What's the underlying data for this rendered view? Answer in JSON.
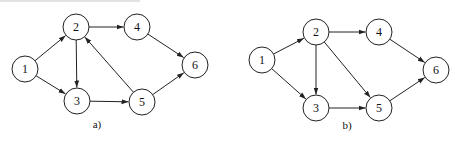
{
  "diagrams": [
    {
      "id": "a",
      "caption": "a)",
      "caption_pos": [
        97,
        128
      ],
      "nodes": [
        {
          "label": "1",
          "x": 25,
          "y": 69
        },
        {
          "label": "2",
          "x": 76,
          "y": 27
        },
        {
          "label": "3",
          "x": 77,
          "y": 101
        },
        {
          "label": "4",
          "x": 137,
          "y": 27
        },
        {
          "label": "5",
          "x": 142,
          "y": 102
        },
        {
          "label": "6",
          "x": 195,
          "y": 65
        }
      ],
      "edges": [
        {
          "from": "1",
          "to": "2"
        },
        {
          "from": "1",
          "to": "3"
        },
        {
          "from": "2",
          "to": "3"
        },
        {
          "from": "2",
          "to": "4"
        },
        {
          "from": "3",
          "to": "5"
        },
        {
          "from": "5",
          "to": "2"
        },
        {
          "from": "4",
          "to": "6"
        },
        {
          "from": "5",
          "to": "6"
        }
      ]
    },
    {
      "id": "b",
      "caption": "b)",
      "caption_pos": [
        347,
        129
      ],
      "nodes": [
        {
          "label": "1",
          "x": 262,
          "y": 60
        },
        {
          "label": "2",
          "x": 316,
          "y": 32
        },
        {
          "label": "3",
          "x": 316,
          "y": 108
        },
        {
          "label": "4",
          "x": 379,
          "y": 32
        },
        {
          "label": "5",
          "x": 379,
          "y": 108
        },
        {
          "label": "6",
          "x": 436,
          "y": 70
        }
      ],
      "edges": [
        {
          "from": "1",
          "to": "2"
        },
        {
          "from": "1",
          "to": "3"
        },
        {
          "from": "2",
          "to": "3"
        },
        {
          "from": "2",
          "to": "4"
        },
        {
          "from": "2",
          "to": "5"
        },
        {
          "from": "3",
          "to": "5"
        },
        {
          "from": "4",
          "to": "6"
        },
        {
          "from": "5",
          "to": "6"
        }
      ]
    }
  ],
  "style": {
    "node_radius": 13,
    "stroke": "#222222",
    "fill": "#ffffff",
    "text": "#111111"
  }
}
